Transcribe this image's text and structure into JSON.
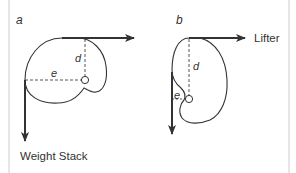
{
  "figure": {
    "panels": [
      {
        "id": "a",
        "label": "a",
        "moment_arm_vertical_label": "d",
        "moment_arm_horizontal_label": "e",
        "force_label": "Weight Stack"
      },
      {
        "id": "b",
        "label": "b",
        "moment_arm_vertical_label": "d",
        "moment_arm_horizontal_label": "e",
        "force_label": "Lifter"
      }
    ],
    "colors": {
      "line": "#333333",
      "dashed": "#555555",
      "border": "#e6e6e6"
    }
  }
}
